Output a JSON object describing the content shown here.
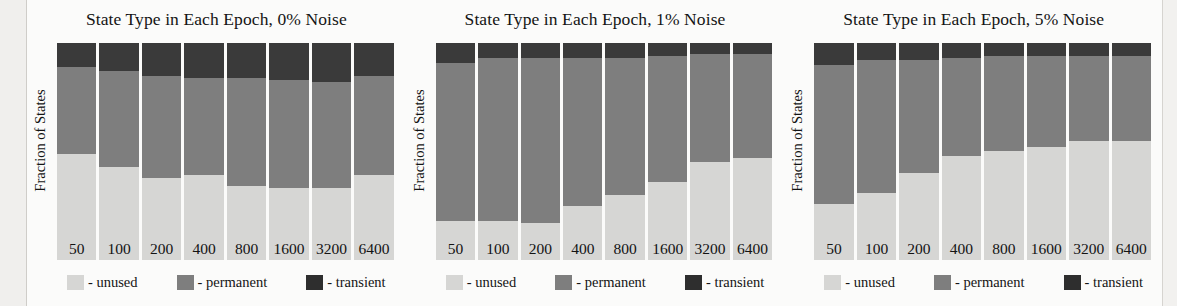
{
  "figure": {
    "ylabel": "Fraction of States",
    "legend": [
      {
        "key": "unused",
        "label": "- unused",
        "color": "#d6d6d4"
      },
      {
        "key": "permanent",
        "label": "- permanent",
        "color": "#7e7e7e"
      },
      {
        "key": "transient",
        "label": "- transient",
        "color": "#2e2e2e"
      }
    ]
  },
  "chart_data": [
    {
      "type": "bar",
      "title": "State Type in Each Epoch, 0% Noise",
      "xlabel": "",
      "ylabel": "Fraction of States",
      "ylim": [
        0,
        1
      ],
      "grid": false,
      "legend_position": "bottom",
      "stacked": true,
      "categories": [
        "50",
        "100",
        "200",
        "400",
        "800",
        "1600",
        "3200",
        "6400"
      ],
      "series": [
        {
          "name": "unused",
          "values": [
            0.49,
            0.43,
            0.38,
            0.39,
            0.34,
            0.33,
            0.33,
            0.39
          ]
        },
        {
          "name": "permanent",
          "values": [
            0.4,
            0.44,
            0.47,
            0.45,
            0.5,
            0.5,
            0.49,
            0.46
          ]
        },
        {
          "name": "transient",
          "values": [
            0.11,
            0.13,
            0.15,
            0.16,
            0.16,
            0.17,
            0.18,
            0.15
          ]
        }
      ]
    },
    {
      "type": "bar",
      "title": "State Type in Each Epoch, 1% Noise",
      "xlabel": "",
      "ylabel": "Fraction of States",
      "ylim": [
        0,
        1
      ],
      "grid": false,
      "legend_position": "bottom",
      "stacked": true,
      "categories": [
        "50",
        "100",
        "200",
        "400",
        "800",
        "1600",
        "3200",
        "6400"
      ],
      "series": [
        {
          "name": "unused",
          "values": [
            0.18,
            0.18,
            0.17,
            0.25,
            0.3,
            0.36,
            0.45,
            0.47
          ]
        },
        {
          "name": "permanent",
          "values": [
            0.73,
            0.75,
            0.76,
            0.68,
            0.63,
            0.58,
            0.5,
            0.48
          ]
        },
        {
          "name": "transient",
          "values": [
            0.09,
            0.07,
            0.07,
            0.07,
            0.07,
            0.06,
            0.05,
            0.05
          ]
        }
      ]
    },
    {
      "type": "bar",
      "title": "State Type in Each Epoch, 5% Noise",
      "xlabel": "",
      "ylabel": "Fraction of States",
      "ylim": [
        0,
        1
      ],
      "grid": false,
      "legend_position": "bottom",
      "stacked": true,
      "categories": [
        "50",
        "100",
        "200",
        "400",
        "800",
        "1600",
        "3200",
        "6400"
      ],
      "series": [
        {
          "name": "unused",
          "values": [
            0.26,
            0.31,
            0.4,
            0.48,
            0.5,
            0.52,
            0.55,
            0.55
          ]
        },
        {
          "name": "permanent",
          "values": [
            0.64,
            0.61,
            0.52,
            0.45,
            0.44,
            0.42,
            0.39,
            0.39
          ]
        },
        {
          "name": "transient",
          "values": [
            0.1,
            0.08,
            0.08,
            0.07,
            0.06,
            0.06,
            0.06,
            0.06
          ]
        }
      ]
    }
  ]
}
